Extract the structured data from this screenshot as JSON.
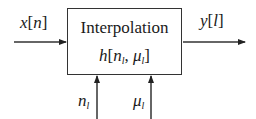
{
  "block": {
    "title": "Interpolation",
    "function": {
      "name": "h",
      "open": "[",
      "arg1": "n",
      "arg1_sub": "l",
      "sep": ", ",
      "arg2": "μ",
      "arg2_sub": "l",
      "close": "]"
    }
  },
  "input": {
    "name": "x",
    "open": "[",
    "index": "n",
    "close": "]"
  },
  "output": {
    "name": "y",
    "open": "[",
    "index": "l",
    "close": "]"
  },
  "controls": [
    {
      "name": "n",
      "sub": "l"
    },
    {
      "name": "μ",
      "sub": "l"
    }
  ],
  "colors": {
    "line": "#333333",
    "text": "#1a1a1a",
    "background": "#ffffff"
  }
}
